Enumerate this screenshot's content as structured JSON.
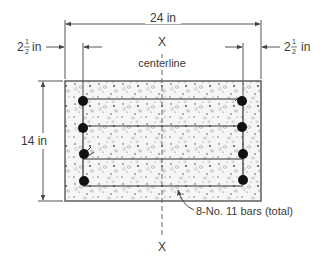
{
  "diagram": {
    "type": "reinforced-concrete-beam-cross-section",
    "width_label": "24 in",
    "height_label": "14 in",
    "cover_left": {
      "whole": "2",
      "num": "1",
      "den": "2",
      "unit": "in"
    },
    "cover_right": {
      "whole": "2",
      "num": "1",
      "den": "2",
      "unit": "in"
    },
    "centerline_label": "centerline",
    "axis_top_label": "X",
    "axis_bottom_label": "X",
    "bars_label": "8-No. 11 bars (total)",
    "bar_count": 8,
    "colors": {
      "line": "#555555",
      "concrete": "#f4f4f4",
      "bar": "#111111",
      "text": "#3a3a3a"
    }
  }
}
